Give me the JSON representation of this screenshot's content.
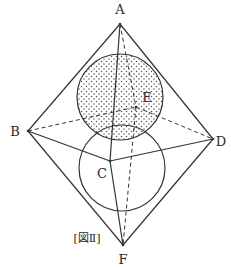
{
  "figure": {
    "caption": "[図Ⅱ]",
    "colors": {
      "line": "#333333",
      "dot": "#555555",
      "background": "#ffffff"
    }
  },
  "vertices": {
    "A": {
      "label": "A",
      "x": 120,
      "y": 24
    },
    "B": {
      "label": "B",
      "x": 28,
      "y": 131
    },
    "C": {
      "label": "C",
      "x": 110,
      "y": 161
    },
    "D": {
      "label": "D",
      "x": 213,
      "y": 139
    },
    "E": {
      "label": "E",
      "x": 136,
      "y": 107
    },
    "F": {
      "label": "F",
      "x": 123,
      "y": 245
    }
  },
  "spheres": [
    {
      "name": "upper-sphere",
      "cx": 120,
      "cy": 97,
      "r": 43,
      "shaded": true
    },
    {
      "name": "lower-sphere",
      "cx": 122,
      "cy": 168,
      "r": 43,
      "shaded": false
    }
  ],
  "edges": {
    "solid": [
      [
        "A",
        "B"
      ],
      [
        "A",
        "D"
      ],
      [
        "A",
        "C"
      ],
      [
        "B",
        "C"
      ],
      [
        "C",
        "D"
      ],
      [
        "B",
        "F"
      ],
      [
        "D",
        "F"
      ],
      [
        "C",
        "F"
      ]
    ],
    "dashed": [
      [
        "A",
        "E"
      ],
      [
        "B",
        "E"
      ],
      [
        "E",
        "D"
      ],
      [
        "E",
        "F"
      ]
    ]
  }
}
